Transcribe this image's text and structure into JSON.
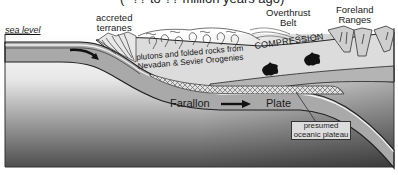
{
  "diagram": {
    "title_partial": "(~?? to ?? million years ago)",
    "labels": {
      "sea_level": "sea level",
      "accreted_terranes": "accreted\nterranes",
      "accreted_line1": "accreted",
      "accreted_line2": "terranes",
      "overthrust_line1": "Overthrust",
      "overthrust_line2": "Belt",
      "foreland_line1": "Foreland",
      "foreland_line2": "Ranges",
      "plutons_line1": "plutons and folded rocks from",
      "plutons_line2": "Nevadan & Sevier Orogenies",
      "compression": "COMPRESSION",
      "farallon": "Farallon",
      "plate": "Plate",
      "presumed_line1": "presumed",
      "presumed_line2": "oceanic plateau"
    },
    "colors": {
      "plate_gray": "#a8a8a8",
      "crust_light": "#d9d9d9",
      "mantle_gradient_top": "#ffffff",
      "mantle_gradient_bottom": "#5a5a5a",
      "outline": "#222222",
      "plateau_hatch": "#555555"
    }
  }
}
